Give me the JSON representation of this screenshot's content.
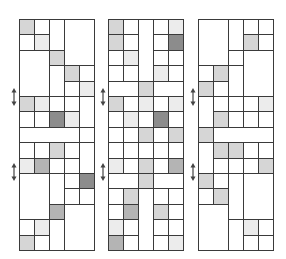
{
  "figure": {
    "grid": {
      "columns": 5,
      "rows": 15,
      "col_width": 15,
      "row_height": 15.4,
      "top": 19
    },
    "shades": {
      "0": "#ffffff",
      "1": "#ececec",
      "2": "#d6d6d6",
      "3": "#b4b4b4",
      "4": "#8c8c8c"
    },
    "line_color": "#3a3a3a",
    "arrow_color": "#444444",
    "panels": [
      {
        "name": "panel-1",
        "left": 19,
        "arrows_y": [
          88,
          163
        ],
        "cells": [
          [
            0,
            0,
            1,
            1,
            2
          ],
          [
            1,
            0,
            1,
            1,
            0
          ],
          [
            2,
            0,
            1,
            2,
            0
          ],
          [
            3,
            0,
            2,
            3,
            0
          ],
          [
            0,
            1,
            1,
            1,
            0
          ],
          [
            1,
            1,
            1,
            1,
            1
          ],
          [
            0,
            2,
            2,
            3,
            0
          ],
          [
            2,
            2,
            1,
            1,
            2
          ],
          [
            2,
            3,
            1,
            2,
            0
          ],
          [
            3,
            3,
            1,
            1,
            2
          ],
          [
            4,
            3,
            1,
            1,
            0
          ],
          [
            3,
            4,
            1,
            1,
            0
          ],
          [
            4,
            4,
            1,
            1,
            1
          ],
          [
            0,
            5,
            1,
            1,
            2
          ],
          [
            1,
            5,
            1,
            1,
            1
          ],
          [
            2,
            5,
            1,
            1,
            0
          ],
          [
            3,
            5,
            1,
            1,
            0
          ],
          [
            4,
            5,
            1,
            2,
            0
          ],
          [
            0,
            6,
            1,
            1,
            0
          ],
          [
            1,
            6,
            1,
            1,
            0
          ],
          [
            2,
            6,
            1,
            1,
            4
          ],
          [
            3,
            6,
            1,
            1,
            1
          ],
          [
            0,
            7,
            4,
            1,
            0
          ],
          [
            4,
            7,
            1,
            1,
            0
          ],
          [
            0,
            8,
            1,
            1,
            0
          ],
          [
            1,
            8,
            1,
            1,
            0
          ],
          [
            2,
            8,
            1,
            1,
            2
          ],
          [
            3,
            8,
            1,
            1,
            0
          ],
          [
            4,
            8,
            1,
            2,
            0
          ],
          [
            0,
            9,
            1,
            1,
            1
          ],
          [
            1,
            9,
            1,
            1,
            3
          ],
          [
            2,
            9,
            1,
            1,
            0
          ],
          [
            3,
            9,
            1,
            1,
            0
          ],
          [
            0,
            10,
            2,
            3,
            0
          ],
          [
            2,
            10,
            1,
            2,
            0
          ],
          [
            3,
            10,
            1,
            1,
            0
          ],
          [
            4,
            10,
            1,
            1,
            4
          ],
          [
            3,
            11,
            1,
            1,
            0
          ],
          [
            4,
            11,
            1,
            1,
            0
          ],
          [
            2,
            12,
            1,
            1,
            3
          ],
          [
            3,
            12,
            2,
            3,
            0
          ],
          [
            0,
            13,
            1,
            1,
            0
          ],
          [
            1,
            13,
            1,
            1,
            1
          ],
          [
            2,
            13,
            1,
            2,
            0
          ],
          [
            0,
            14,
            1,
            1,
            2
          ],
          [
            1,
            14,
            1,
            1,
            0
          ]
        ]
      },
      {
        "name": "panel-2",
        "left": 108,
        "arrows_y": [
          88,
          163
        ],
        "cells": [
          [
            0,
            0,
            1,
            1,
            2
          ],
          [
            1,
            0,
            1,
            1,
            0
          ],
          [
            2,
            0,
            1,
            4,
            0
          ],
          [
            3,
            0,
            1,
            1,
            0
          ],
          [
            4,
            0,
            1,
            1,
            1
          ],
          [
            0,
            1,
            1,
            1,
            2
          ],
          [
            1,
            1,
            1,
            1,
            0
          ],
          [
            3,
            1,
            1,
            1,
            0
          ],
          [
            4,
            1,
            1,
            1,
            4
          ],
          [
            0,
            2,
            1,
            1,
            0
          ],
          [
            1,
            2,
            1,
            1,
            1
          ],
          [
            3,
            2,
            1,
            1,
            0
          ],
          [
            4,
            2,
            1,
            1,
            0
          ],
          [
            0,
            3,
            1,
            1,
            0
          ],
          [
            1,
            3,
            1,
            1,
            0
          ],
          [
            3,
            3,
            1,
            1,
            1
          ],
          [
            4,
            3,
            1,
            1,
            0
          ],
          [
            0,
            4,
            2,
            1,
            0
          ],
          [
            2,
            4,
            1,
            1,
            2
          ],
          [
            3,
            4,
            2,
            1,
            0
          ],
          [
            0,
            5,
            1,
            1,
            2
          ],
          [
            1,
            5,
            1,
            1,
            0
          ],
          [
            2,
            5,
            1,
            1,
            1
          ],
          [
            3,
            5,
            1,
            1,
            0
          ],
          [
            4,
            5,
            1,
            1,
            1
          ],
          [
            0,
            6,
            1,
            1,
            0
          ],
          [
            1,
            6,
            1,
            1,
            1
          ],
          [
            2,
            6,
            1,
            1,
            0
          ],
          [
            3,
            6,
            1,
            1,
            4
          ],
          [
            4,
            6,
            1,
            1,
            0
          ],
          [
            0,
            7,
            1,
            1,
            0
          ],
          [
            1,
            7,
            1,
            1,
            0
          ],
          [
            2,
            7,
            1,
            1,
            2
          ],
          [
            3,
            7,
            1,
            1,
            0
          ],
          [
            4,
            7,
            1,
            1,
            2
          ],
          [
            0,
            8,
            1,
            1,
            0
          ],
          [
            1,
            8,
            1,
            1,
            0
          ],
          [
            2,
            8,
            1,
            1,
            0
          ],
          [
            3,
            8,
            1,
            1,
            0
          ],
          [
            4,
            8,
            1,
            1,
            0
          ],
          [
            0,
            9,
            1,
            1,
            1
          ],
          [
            1,
            9,
            1,
            1,
            0
          ],
          [
            2,
            9,
            1,
            1,
            2
          ],
          [
            3,
            9,
            1,
            1,
            0
          ],
          [
            4,
            9,
            1,
            1,
            3
          ],
          [
            0,
            10,
            2,
            1,
            0
          ],
          [
            2,
            10,
            1,
            1,
            2
          ],
          [
            3,
            10,
            2,
            1,
            0
          ],
          [
            0,
            11,
            1,
            1,
            0
          ],
          [
            1,
            11,
            1,
            1,
            2
          ],
          [
            2,
            11,
            1,
            4,
            0
          ],
          [
            3,
            11,
            1,
            1,
            0
          ],
          [
            4,
            11,
            1,
            1,
            0
          ],
          [
            0,
            12,
            1,
            1,
            0
          ],
          [
            1,
            12,
            1,
            1,
            3
          ],
          [
            3,
            12,
            1,
            1,
            2
          ],
          [
            4,
            12,
            1,
            1,
            0
          ],
          [
            0,
            13,
            1,
            1,
            1
          ],
          [
            1,
            13,
            1,
            1,
            0
          ],
          [
            3,
            13,
            1,
            1,
            0
          ],
          [
            4,
            13,
            1,
            1,
            0
          ],
          [
            0,
            14,
            1,
            1,
            3
          ],
          [
            1,
            14,
            1,
            1,
            0
          ],
          [
            3,
            14,
            1,
            1,
            0
          ],
          [
            4,
            14,
            1,
            1,
            1
          ]
        ]
      },
      {
        "name": "panel-3",
        "left": 198,
        "arrows_y": [
          88,
          163
        ],
        "cells": [
          [
            0,
            0,
            2,
            3,
            0
          ],
          [
            2,
            0,
            1,
            2,
            0
          ],
          [
            3,
            0,
            1,
            1,
            0
          ],
          [
            4,
            0,
            1,
            1,
            0
          ],
          [
            3,
            1,
            1,
            1,
            2
          ],
          [
            4,
            1,
            1,
            1,
            0
          ],
          [
            2,
            2,
            1,
            1,
            0
          ],
          [
            3,
            2,
            2,
            3,
            0
          ],
          [
            0,
            3,
            1,
            1,
            0
          ],
          [
            1,
            3,
            1,
            1,
            2
          ],
          [
            2,
            3,
            1,
            2,
            0
          ],
          [
            0,
            4,
            1,
            1,
            2
          ],
          [
            1,
            4,
            1,
            1,
            0
          ],
          [
            0,
            5,
            1,
            2,
            0
          ],
          [
            1,
            5,
            1,
            1,
            0
          ],
          [
            2,
            5,
            1,
            1,
            0
          ],
          [
            3,
            5,
            1,
            1,
            0
          ],
          [
            4,
            5,
            1,
            1,
            1
          ],
          [
            1,
            6,
            1,
            1,
            2
          ],
          [
            2,
            6,
            1,
            1,
            0
          ],
          [
            3,
            6,
            1,
            1,
            0
          ],
          [
            4,
            6,
            1,
            1,
            0
          ],
          [
            0,
            7,
            1,
            1,
            2
          ],
          [
            1,
            7,
            4,
            1,
            0
          ],
          [
            0,
            8,
            1,
            2,
            0
          ],
          [
            1,
            8,
            1,
            1,
            2
          ],
          [
            2,
            8,
            1,
            1,
            2
          ],
          [
            3,
            8,
            1,
            1,
            0
          ],
          [
            4,
            8,
            1,
            1,
            0
          ],
          [
            1,
            9,
            1,
            1,
            0
          ],
          [
            2,
            9,
            1,
            1,
            0
          ],
          [
            3,
            9,
            1,
            1,
            0
          ],
          [
            4,
            9,
            1,
            1,
            2
          ],
          [
            0,
            10,
            1,
            1,
            2
          ],
          [
            1,
            10,
            1,
            1,
            0
          ],
          [
            2,
            10,
            1,
            3,
            0
          ],
          [
            3,
            10,
            2,
            3,
            0
          ],
          [
            0,
            11,
            1,
            1,
            0
          ],
          [
            1,
            11,
            1,
            1,
            2
          ],
          [
            0,
            12,
            2,
            3,
            0
          ],
          [
            2,
            13,
            1,
            2,
            0
          ],
          [
            3,
            13,
            1,
            1,
            1
          ],
          [
            4,
            13,
            1,
            1,
            0
          ],
          [
            3,
            14,
            1,
            1,
            0
          ],
          [
            4,
            14,
            1,
            1,
            0
          ]
        ]
      }
    ]
  }
}
